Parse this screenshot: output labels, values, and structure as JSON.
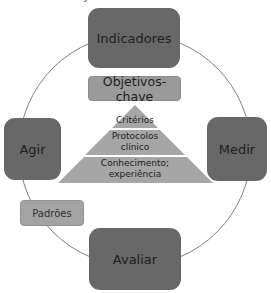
{
  "diagram": {
    "top_caption": "Estrutura de objetivos e ciclo de melhoria",
    "cycle_nodes": {
      "top": "Indicadores",
      "right": "Medir",
      "bottom": "Avaliar",
      "left": "Agir"
    },
    "key_objectives": "Objetivos-chave",
    "pyramid": {
      "tiers": [
        {
          "label": "Critérios"
        },
        {
          "label_line1": "Protocolos",
          "label_line2": "clínico"
        },
        {
          "label_line1": "Conhecimento;",
          "label_line2": "experiência"
        }
      ]
    },
    "standards": "Padrões",
    "colors": {
      "cycle_node": "#686868",
      "secondary_box": "#9a9a9a",
      "pyramid": "#a6a6a6",
      "circle_line": "#6f6f6f"
    }
  }
}
